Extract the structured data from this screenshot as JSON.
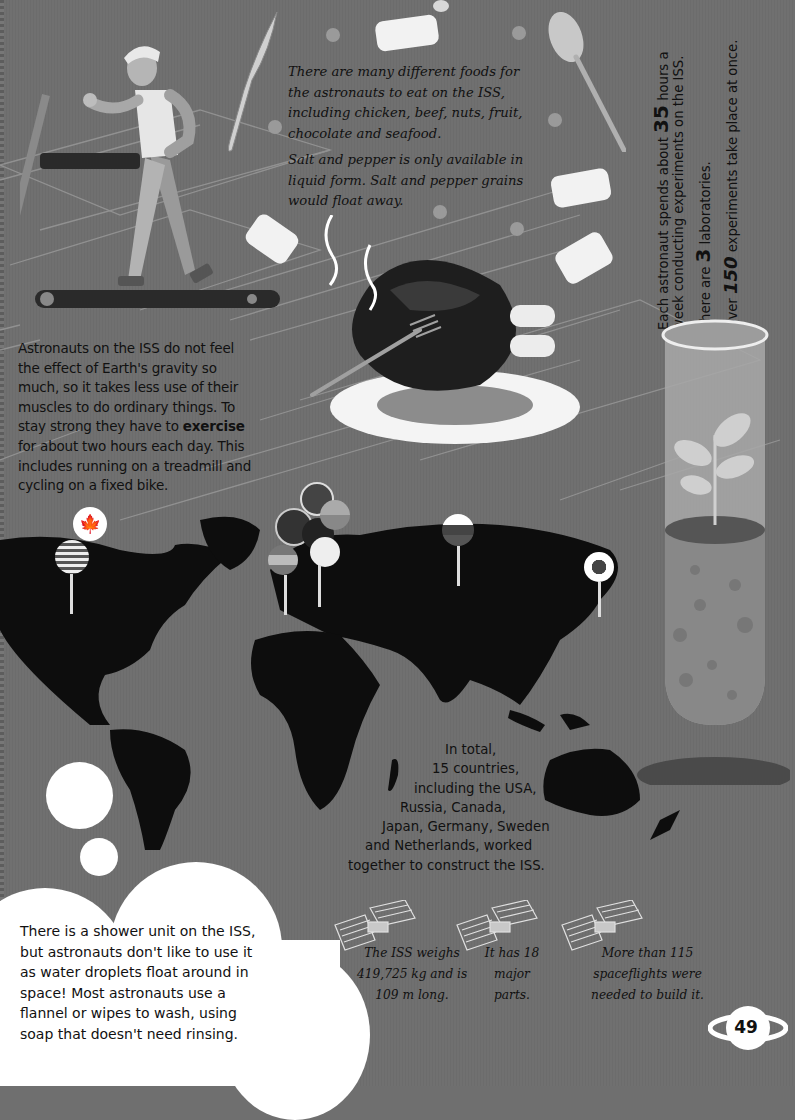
{
  "page": {
    "number": "49",
    "background_color": "#707070"
  },
  "food": {
    "paragraph1": "There are many different foods for the astronauts to eat on the ISS, including chicken, beef, nuts, fruit, chocolate and seafood.",
    "paragraph2": "Salt and pepper is only available in liquid form. Salt and pepper grains would float away.",
    "illustrations": [
      "knife-icon",
      "spoon-icon",
      "fork-icon",
      "roast-chicken-icon",
      "plate-icon",
      "food-chunk-icon",
      "bubble-icon"
    ]
  },
  "exercise": {
    "before": "Astronauts on the ISS do not feel the effect of Earth's gravity so much, so it takes less use of their muscles to do ordinary things. To stay strong they have to ",
    "bold": "exercise",
    "after": " for about two hours each day. This includes running on a treadmill and cycling on a fixed bike.",
    "illustration": "astronaut-on-treadmill-icon"
  },
  "experiments": {
    "line1_prefix": "Each astronaut spends about ",
    "line1_number": "35",
    "line1_suffix": " hours a week conducting experiments on the ISS.",
    "line2_prefix": "There are ",
    "line2_number": "3",
    "line2_suffix": " laboratories.",
    "line3_prefix": "Over ",
    "line3_number": "150",
    "line3_suffix": " experiments take place at once.",
    "illustration": "test-tube-plant-icon"
  },
  "countries": {
    "lines": [
      "In total,",
      "15 countries,",
      "including the USA,",
      "Russia, Canada,",
      "Japan, Germany, Sweden",
      "and Netherlands, worked",
      "together to construct the ISS."
    ],
    "map_pins": [
      "usa-flag-pin",
      "canada-flag-pin",
      "uk-flag-pin",
      "europe-flag-pins",
      "russia-flag-pin",
      "japan-flag-pin"
    ]
  },
  "shower": {
    "text": "There is a shower unit on the ISS, but astronauts don't like to use it as water droplets float around in space! Most astronauts use a flannel or wipes to wash, using soap that doesn't need rinsing."
  },
  "facts": [
    {
      "lines": [
        "The ISS weighs",
        "419,725 kg and is",
        "109 m long."
      ],
      "icon": "iss-station-icon"
    },
    {
      "lines": [
        "It has 18",
        "major",
        "parts."
      ],
      "icon": "iss-station-icon"
    },
    {
      "lines": [
        "More than 115",
        "spaceflights were",
        "needed to build it."
      ],
      "icon": "iss-station-icon"
    }
  ]
}
